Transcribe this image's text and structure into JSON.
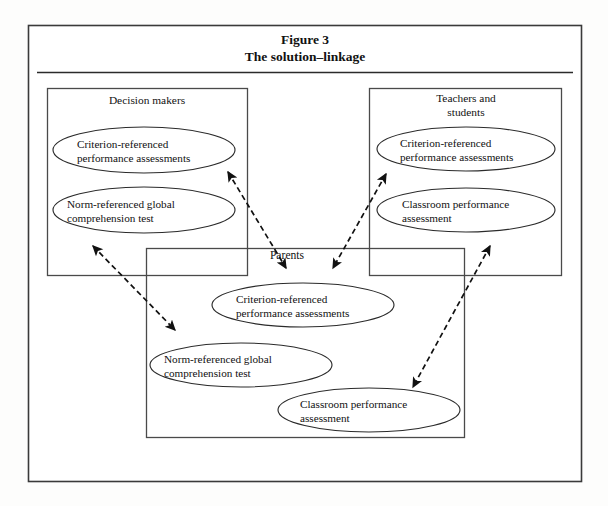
{
  "figure": {
    "title_line1": "Figure 3",
    "title_line2": "The solution–linkage",
    "groups": [
      {
        "id": "decision-makers",
        "label": "Decision makers",
        "label_lines": [
          "Decision makers"
        ],
        "nodes": [
          {
            "id": "dm-crp",
            "lines": [
              "Criterion-referenced",
              "performance assessments"
            ]
          },
          {
            "id": "dm-nrg",
            "lines": [
              "Norm-referenced global",
              "comprehension test"
            ]
          }
        ]
      },
      {
        "id": "teachers-and-students",
        "label": "Teachers and students",
        "label_lines": [
          "Teachers and",
          "students"
        ],
        "nodes": [
          {
            "id": "ts-crp",
            "lines": [
              "Criterion-referenced",
              "performance assessments"
            ]
          },
          {
            "id": "ts-cpa",
            "lines": [
              "Classroom performance",
              "assessment"
            ]
          }
        ]
      },
      {
        "id": "parents",
        "label": "Parents",
        "label_lines": [
          "Parents"
        ],
        "nodes": [
          {
            "id": "pa-crp",
            "lines": [
              "Criterion-referenced",
              "performance assessments"
            ]
          },
          {
            "id": "pa-nrg",
            "lines": [
              "Norm-referenced global",
              "comprehension test"
            ]
          },
          {
            "id": "pa-cpa",
            "lines": [
              "Classroom performance",
              "assessment"
            ]
          }
        ]
      }
    ],
    "links": [
      {
        "id": "link-decision-makers-parents",
        "from": "decision-makers",
        "to": "parents",
        "style": "dashed",
        "heads": "both"
      },
      {
        "id": "link-decision-makers-teachers",
        "from": "decision-makers",
        "to": "parents",
        "style": "dashed",
        "heads": "both"
      },
      {
        "id": "link-teachers-parents",
        "from": "teachers-and-students",
        "to": "parents",
        "style": "dashed",
        "heads": "both"
      },
      {
        "id": "link-teachers-parents-right",
        "from": "teachers-and-students",
        "to": "parents",
        "style": "dashed",
        "heads": "both"
      }
    ],
    "colors": {
      "background": "#fdfdfc",
      "frame_stroke": "#3a3a3a",
      "box_stroke": "#4a4a4a",
      "ellipse_stroke": "#2b2b2b",
      "arrow_stroke": "#111111",
      "text": "#111111"
    }
  }
}
